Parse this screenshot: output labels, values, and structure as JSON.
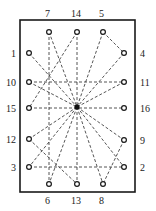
{
  "diagram": {
    "frame": {
      "x": 20,
      "y": 20,
      "width": 115,
      "height": 172
    },
    "center": {
      "x": 77,
      "y": 107
    },
    "points": [
      {
        "id": "1",
        "x": 29,
        "y": 53,
        "label_x": 11,
        "label_y": 57,
        "label": "1"
      },
      {
        "id": "2",
        "x": 124,
        "y": 167,
        "label_x": 140,
        "label_y": 171,
        "label": "2"
      },
      {
        "id": "3",
        "x": 29,
        "y": 167,
        "label_x": 11,
        "label_y": 171,
        "label": "3"
      },
      {
        "id": "4",
        "x": 124,
        "y": 53,
        "label_x": 140,
        "label_y": 57,
        "label": "4"
      },
      {
        "id": "5",
        "x": 103,
        "y": 32,
        "label_x": 99,
        "label_y": 17,
        "label": "5"
      },
      {
        "id": "6",
        "x": 49,
        "y": 184,
        "label_x": 45,
        "label_y": 204,
        "label": "6"
      },
      {
        "id": "7",
        "x": 49,
        "y": 32,
        "label_x": 45,
        "label_y": 17,
        "label": "7"
      },
      {
        "id": "8",
        "x": 103,
        "y": 184,
        "label_x": 99,
        "label_y": 204,
        "label": "8"
      },
      {
        "id": "9",
        "x": 124,
        "y": 140,
        "label_x": 140,
        "label_y": 144,
        "label": "9"
      },
      {
        "id": "10",
        "x": 29,
        "y": 82,
        "label_x": 6,
        "label_y": 86,
        "label": "10"
      },
      {
        "id": "11",
        "x": 124,
        "y": 82,
        "label_x": 140,
        "label_y": 86,
        "label": "11"
      },
      {
        "id": "12",
        "x": 29,
        "y": 139,
        "label_x": 6,
        "label_y": 143,
        "label": "12"
      },
      {
        "id": "13",
        "x": 77,
        "y": 184,
        "label_x": 71,
        "label_y": 204,
        "label": "13"
      },
      {
        "id": "14",
        "x": 77,
        "y": 32,
        "label_x": 71,
        "label_y": 17,
        "label": "14"
      },
      {
        "id": "15",
        "x": 29,
        "y": 108,
        "label_x": 6,
        "label_y": 112,
        "label": "15"
      },
      {
        "id": "16",
        "x": 124,
        "y": 108,
        "label_x": 140,
        "label_y": 112,
        "label": "16"
      }
    ],
    "edges": [
      [
        "7",
        "C"
      ],
      [
        "7",
        "6"
      ],
      [
        "14",
        "C"
      ],
      [
        "14",
        "15"
      ],
      [
        "5",
        "C"
      ],
      [
        "5",
        "4"
      ],
      [
        "4",
        "C"
      ],
      [
        "1",
        "C"
      ],
      [
        "10",
        "11"
      ],
      [
        "10",
        "C"
      ],
      [
        "11",
        "C"
      ],
      [
        "15",
        "16"
      ],
      [
        "C",
        "12"
      ],
      [
        "C",
        "9"
      ],
      [
        "C",
        "3"
      ],
      [
        "C",
        "2"
      ],
      [
        "C",
        "13"
      ],
      [
        "C",
        "8"
      ],
      [
        "C",
        "6"
      ],
      [
        "12",
        "13"
      ],
      [
        "3",
        "2"
      ],
      [
        "9",
        "8"
      ]
    ]
  }
}
